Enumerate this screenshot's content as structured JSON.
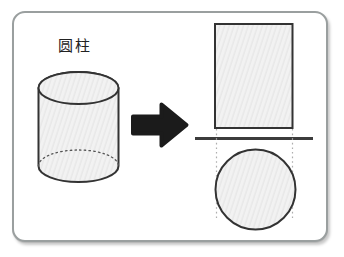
{
  "diagram": {
    "label": "圆柱"
  },
  "icons": {
    "arrow": "right-arrow"
  },
  "colors": {
    "page-bg": "#ffffff",
    "card-bg": "#ffffff",
    "card-border": "#9a9f9f",
    "label-text": "#222222",
    "shape-stroke": "#333333",
    "shape-fill": "#f2f2f2",
    "hatch-line": "#e3e3e3",
    "hidden-edge": "#555555",
    "divider": "#3c3c3c",
    "dotted": "#aeaeae",
    "arrow-fill": "#1b1b1b"
  }
}
